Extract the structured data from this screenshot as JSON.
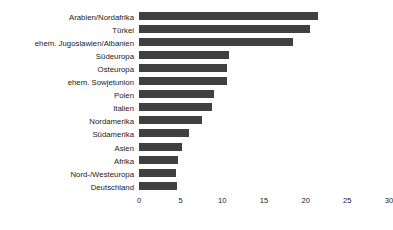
{
  "chart_data": {
    "type": "bar",
    "orientation": "horizontal",
    "title": "",
    "subtitle": "",
    "xlabel": "",
    "ylabel": "",
    "xlim": [
      0,
      30
    ],
    "xticks": [
      0,
      5,
      10,
      15,
      20,
      25,
      30
    ],
    "xtick_labels": [
      "0",
      "5",
      "10",
      "15",
      "20",
      "25",
      "30"
    ],
    "grid": false,
    "legend": false,
    "bar_color": "#404040",
    "categories": [
      "Arabien/Nordafrika",
      "Türkei",
      "ehem. Jugoslawien/Albanien",
      "Südeuropa",
      "Osteuropa",
      "ehem. Sowjetunion",
      "Polen",
      "Italien",
      "Nordamerika",
      "Südamerika",
      "Asien",
      "Afrika",
      "Nord-/Westeuropa",
      "Deutschland"
    ],
    "values": [
      21.5,
      20.5,
      18.5,
      10.8,
      10.5,
      10.5,
      9.0,
      8.7,
      7.6,
      6.0,
      5.2,
      4.7,
      4.4,
      4.5
    ]
  }
}
